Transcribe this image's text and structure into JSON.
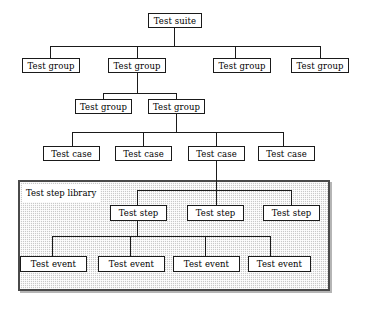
{
  "diagram": {
    "panel": {
      "label": "Test step library",
      "fill_color": "#c9c9c9",
      "border_color": "#4a4a4a"
    },
    "line_color": "#1a1a1a",
    "box_fill": "#ffffff",
    "levels": [
      {
        "name": "test-suite",
        "nodes": [
          {
            "label": "Test suite",
            "x": 148,
            "y": 13,
            "w": 54,
            "h": 15
          }
        ]
      },
      {
        "name": "test-group-level-1",
        "nodes": [
          {
            "label": "Test group",
            "x": 22,
            "y": 58,
            "w": 58,
            "h": 15
          },
          {
            "label": "Test group",
            "x": 108,
            "y": 58,
            "w": 58,
            "h": 15
          },
          {
            "label": "Test group",
            "x": 213,
            "y": 58,
            "w": 58,
            "h": 15
          },
          {
            "label": "Test group",
            "x": 291,
            "y": 58,
            "w": 58,
            "h": 15
          }
        ]
      },
      {
        "name": "test-group-level-2",
        "nodes": [
          {
            "label": "Test group",
            "x": 75,
            "y": 99,
            "w": 57,
            "h": 15
          },
          {
            "label": "Test group",
            "x": 148,
            "y": 99,
            "w": 57,
            "h": 15
          }
        ]
      },
      {
        "name": "test-case-level",
        "nodes": [
          {
            "label": "Test case",
            "x": 43,
            "y": 146,
            "w": 57,
            "h": 15
          },
          {
            "label": "Test case",
            "x": 115,
            "y": 146,
            "w": 57,
            "h": 15
          },
          {
            "label": "Test case",
            "x": 188,
            "y": 146,
            "w": 57,
            "h": 15
          },
          {
            "label": "Test case",
            "x": 258,
            "y": 146,
            "w": 57,
            "h": 15
          }
        ]
      },
      {
        "name": "test-step-level",
        "nodes": [
          {
            "label": "Test step",
            "x": 110,
            "y": 205,
            "w": 57,
            "h": 16
          },
          {
            "label": "Test step",
            "x": 187,
            "y": 205,
            "w": 57,
            "h": 16
          },
          {
            "label": "Test step",
            "x": 263,
            "y": 205,
            "w": 57,
            "h": 16
          }
        ]
      },
      {
        "name": "test-event-level",
        "nodes": [
          {
            "label": "Test event",
            "x": 20,
            "y": 256,
            "w": 67,
            "h": 16
          },
          {
            "label": "Test event",
            "x": 98,
            "y": 256,
            "w": 67,
            "h": 16
          },
          {
            "label": "Test event",
            "x": 173,
            "y": 256,
            "w": 67,
            "h": 16
          },
          {
            "label": "Test event",
            "x": 248,
            "y": 256,
            "w": 63,
            "h": 16
          }
        ]
      }
    ],
    "edges": [
      {
        "name": "suite-stem-down",
        "type": "v",
        "x": 174,
        "y": 28,
        "len": 18
      },
      {
        "name": "group1-bus",
        "type": "h",
        "x": 50,
        "y": 46,
        "len": 270
      },
      {
        "name": "group1-drop-1",
        "type": "v",
        "x": 50,
        "y": 46,
        "len": 12
      },
      {
        "name": "group1-drop-2",
        "type": "v",
        "x": 137,
        "y": 46,
        "len": 12
      },
      {
        "name": "group1-drop-3",
        "type": "v",
        "x": 235,
        "y": 46,
        "len": 12
      },
      {
        "name": "group1-drop-4",
        "type": "v",
        "x": 320,
        "y": 46,
        "len": 12
      },
      {
        "name": "group1b-stem-down",
        "type": "v",
        "x": 137,
        "y": 73,
        "len": 20
      },
      {
        "name": "group2-bus",
        "type": "h",
        "x": 103,
        "y": 93,
        "len": 74
      },
      {
        "name": "group2-drop-1",
        "type": "v",
        "x": 103,
        "y": 93,
        "len": 6
      },
      {
        "name": "group2-drop-2",
        "type": "v",
        "x": 176,
        "y": 93,
        "len": 6
      },
      {
        "name": "group2b-stem-down",
        "type": "v",
        "x": 176,
        "y": 114,
        "len": 18
      },
      {
        "name": "case-bus",
        "type": "h",
        "x": 72,
        "y": 132,
        "len": 211
      },
      {
        "name": "case-drop-1",
        "type": "v",
        "x": 72,
        "y": 132,
        "len": 14
      },
      {
        "name": "case-drop-2",
        "type": "v",
        "x": 143,
        "y": 132,
        "len": 14
      },
      {
        "name": "case-drop-3",
        "type": "v",
        "x": 216,
        "y": 132,
        "len": 14
      },
      {
        "name": "case-drop-4",
        "type": "v",
        "x": 283,
        "y": 132,
        "len": 14
      },
      {
        "name": "case3-stem-into-panel",
        "type": "v",
        "x": 216,
        "y": 161,
        "len": 44
      },
      {
        "name": "step-bus",
        "type": "h",
        "x": 137,
        "y": 190,
        "len": 154
      },
      {
        "name": "step-drop-1",
        "type": "v",
        "x": 137,
        "y": 190,
        "len": 15
      },
      {
        "name": "step-drop-3",
        "type": "v",
        "x": 291,
        "y": 190,
        "len": 15
      },
      {
        "name": "step1-stem-down",
        "type": "v",
        "x": 137,
        "y": 221,
        "len": 15
      },
      {
        "name": "event-bus",
        "type": "h",
        "x": 52,
        "y": 236,
        "len": 218
      },
      {
        "name": "event-drop-1",
        "type": "v",
        "x": 52,
        "y": 236,
        "len": 20
      },
      {
        "name": "event-drop-2",
        "type": "v",
        "x": 130,
        "y": 236,
        "len": 20
      },
      {
        "name": "event-drop-3",
        "type": "v",
        "x": 205,
        "y": 236,
        "len": 20
      },
      {
        "name": "event-drop-4",
        "type": "v",
        "x": 270,
        "y": 236,
        "len": 20
      }
    ]
  }
}
